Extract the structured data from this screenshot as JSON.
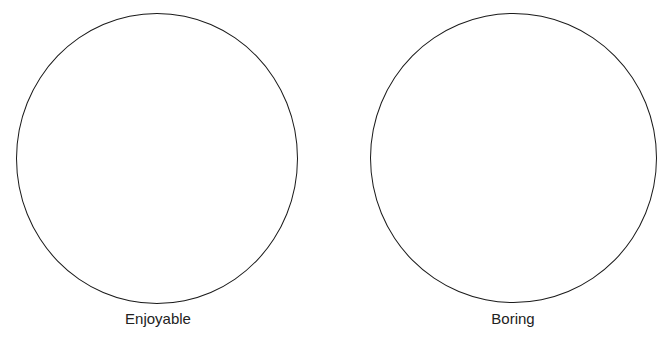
{
  "diagram": {
    "type": "two-circle comparison",
    "line_color": "#1a1a1a",
    "text_color": "#222222",
    "circles": [
      {
        "label": "Enjoyable",
        "cx": 157,
        "cy": 158,
        "r": 141
      },
      {
        "label": "Boring",
        "cx": 513,
        "cy": 158,
        "r": 143
      }
    ]
  }
}
